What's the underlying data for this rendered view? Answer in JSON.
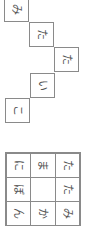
{
  "chain": {
    "cells": [
      {
        "char": "み",
        "x": 4,
        "y": -3
      },
      {
        "char": "た",
        "x": 29,
        "y": 22
      },
      {
        "char": "た",
        "x": 54,
        "y": 47
      },
      {
        "char": "い",
        "x": 30,
        "y": 73
      },
      {
        "char": "こ",
        "x": 5,
        "y": 98
      }
    ]
  },
  "grid": {
    "rows": [
      [
        "に",
        "ま",
        "た"
      ],
      [
        "ぼ",
        "",
        "た"
      ],
      [
        "ん",
        "か",
        "み"
      ]
    ]
  }
}
